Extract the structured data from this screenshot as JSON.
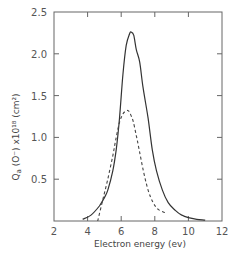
{
  "chart_data": {
    "type": "line",
    "title": "",
    "xlabel": "Electron energy (ev)",
    "ylabel": "Qa (O⁻) x10¹⁸ (cm²)",
    "xlim": [
      2,
      12
    ],
    "ylim": [
      0,
      2.5
    ],
    "xticks": [
      2,
      4,
      6,
      8,
      10,
      12
    ],
    "xtick_labels": [
      "2",
      "4",
      "6",
      "8",
      "10",
      "12"
    ],
    "yticks": [
      0.5,
      1.0,
      1.5,
      2.0,
      2.5
    ],
    "ytick_labels": [
      "0.5",
      "1.0",
      "1.5",
      "2.0",
      "2.5"
    ],
    "grid": false,
    "legend": null,
    "series": [
      {
        "name": "solid",
        "style": "solid",
        "x": [
          3.7,
          4.2,
          4.7,
          5.0,
          5.2,
          5.5,
          5.7,
          5.9,
          6.1,
          6.3,
          6.5,
          6.6,
          6.75,
          6.9,
          7.1,
          7.3,
          7.6,
          7.85,
          8.1,
          8.45,
          8.8,
          9.2,
          9.6,
          10.0,
          10.5,
          11.0
        ],
        "y": [
          0.02,
          0.07,
          0.18,
          0.28,
          0.37,
          0.6,
          0.85,
          1.23,
          1.75,
          2.1,
          2.24,
          2.26,
          2.22,
          2.05,
          1.9,
          1.6,
          1.23,
          0.85,
          0.6,
          0.37,
          0.22,
          0.13,
          0.07,
          0.04,
          0.02,
          0.01
        ]
      },
      {
        "name": "dashed",
        "style": "dashed",
        "x": [
          4.6,
          4.9,
          5.2,
          5.5,
          5.7,
          5.9,
          6.1,
          6.3,
          6.4,
          6.5,
          6.7,
          6.9,
          7.07,
          7.3,
          7.6,
          7.9,
          8.2,
          8.6
        ],
        "y": [
          0.0,
          0.25,
          0.5,
          0.78,
          1.0,
          1.18,
          1.28,
          1.32,
          1.32,
          1.3,
          1.2,
          1.02,
          0.85,
          0.62,
          0.37,
          0.22,
          0.14,
          0.1
        ]
      }
    ]
  },
  "axes": {
    "x_title": "Electron energy (ev)",
    "y_title_main": "Q",
    "y_title_sub": "a",
    "y_title_rest": " (O⁻) x10¹⁸ (cm²)"
  }
}
